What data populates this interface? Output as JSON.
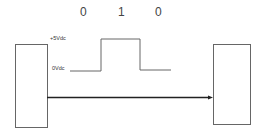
{
  "diagram": {
    "bits": [
      "0",
      "1",
      "0"
    ],
    "labels": {
      "high": "+5Vdc",
      "low": "0Vdc"
    },
    "nodes": [
      {
        "id": "sender",
        "label": ""
      },
      {
        "id": "receiver",
        "label": ""
      }
    ],
    "edges": [
      {
        "from": "sender",
        "to": "receiver",
        "type": "arrow"
      }
    ],
    "colors": {
      "line": "#555555",
      "arrow": "#222222",
      "text": "#444444"
    }
  }
}
